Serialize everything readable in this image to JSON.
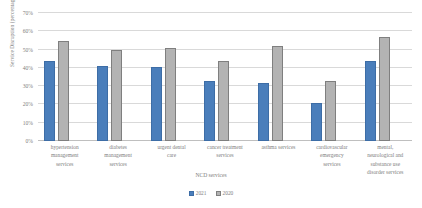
{
  "chart_data": {
    "type": "bar",
    "title": "",
    "subtitle": "",
    "xlabel": "NCD services",
    "ylabel": "Service Disruption (percentage)",
    "ylim": [
      0,
      70
    ],
    "yticks": [
      0,
      10,
      20,
      30,
      40,
      50,
      60,
      70
    ],
    "ytick_labels": [
      "0%",
      "10%",
      "20%",
      "30%",
      "40%",
      "50%",
      "60%",
      "70%"
    ],
    "ytick_suffix": "%",
    "grid": true,
    "legend_position": "bottom",
    "categories": [
      "hypertension management services",
      "diabetes management services",
      "urgent dental care",
      "cancer treatment services",
      "asthma services",
      "cardiovascular emergency services",
      "mental, neurological and substance use disorder services"
    ],
    "category_lines": [
      [
        "hypertension",
        "management",
        "services"
      ],
      [
        "diabetes",
        "management",
        "services"
      ],
      [
        "urgent dental",
        "care"
      ],
      [
        "cancer treatment",
        "services"
      ],
      [
        "asthma services"
      ],
      [
        "cardiovascular",
        "emergency",
        "services"
      ],
      [
        "mental,",
        "neurological and",
        "substance use",
        "disorder services"
      ]
    ],
    "series": [
      {
        "name": "2021",
        "color": "#4a7ebb",
        "values": [
          43.5,
          41,
          40.5,
          33,
          31.5,
          21,
          44
        ]
      },
      {
        "name": "2020",
        "color": "#b3b3b3",
        "values": [
          54.5,
          50,
          51,
          44,
          52,
          33,
          57
        ]
      }
    ]
  },
  "legend": {
    "entries": [
      {
        "label": "2021"
      },
      {
        "label": "2020"
      }
    ]
  }
}
